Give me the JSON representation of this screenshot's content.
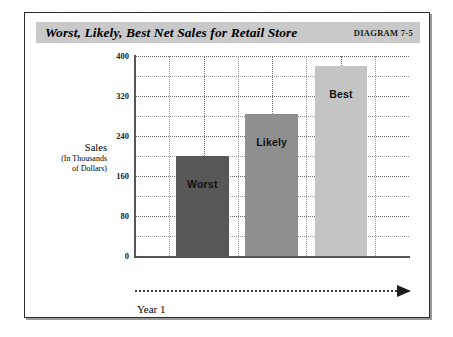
{
  "figure": {
    "title": "Worst, Likely, Best Net Sales for Retail Store",
    "diagram_number": "DIAGRAM 7-5",
    "axis_title_main": "Sales",
    "axis_title_sub_line1": "(In Thousands",
    "axis_title_sub_line2": "of Dollars)",
    "x_axis_label": "Year 1"
  },
  "colors": {
    "title_band": "#c9c9c9",
    "frame_border": "#2c2c2c",
    "grid": "#9d9d9d",
    "axis": "#555555",
    "bar_worst": "#585858",
    "bar_likely": "#8f8f8f",
    "bar_best": "#c4c4c4"
  },
  "chart_data": {
    "type": "bar",
    "title": "Worst, Likely, Best Net Sales for Retail Store",
    "xlabel": "Year 1",
    "ylabel": "Sales (In Thousands of Dollars)",
    "categories": [
      "Worst",
      "Likely",
      "Best"
    ],
    "values": [
      200,
      284,
      380
    ],
    "ylim": [
      0,
      400
    ],
    "yticks": [
      0,
      80,
      160,
      240,
      320,
      400
    ],
    "ytick_labels": [
      "0",
      "80",
      "160",
      "240",
      "320",
      "400"
    ],
    "grid": true,
    "legend": false,
    "bar_colors": [
      "#585858",
      "#8f8f8f",
      "#c4c4c4"
    ],
    "bar_labels_inside": [
      "Worst",
      "Likely",
      "Best"
    ],
    "annotations": [
      "DIAGRAM 7-5"
    ]
  }
}
